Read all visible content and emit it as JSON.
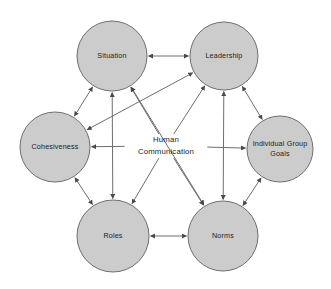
{
  "diagram": {
    "background_color": "#ffffff",
    "node_fill_color": "#cccccc",
    "node_stroke_color": "#6e6e6e",
    "edge_color": "#6e6e6e",
    "text_color": "#1c1c1c",
    "center": {
      "id": "human-communication",
      "line1": "Human",
      "line2": "Communication",
      "x": 166,
      "y": 146
    },
    "nodes": [
      {
        "id": "situation",
        "label": "Situation",
        "line1": "Situation",
        "line2": "",
        "cx": 112,
        "cy": 56,
        "r": 35
      },
      {
        "id": "leadership",
        "label": "Leadership",
        "line1": "Leadership",
        "line2": "",
        "cx": 224,
        "cy": 56,
        "r": 34
      },
      {
        "id": "cohesiveness",
        "label": "Cohesiveness",
        "line1": "Cohesiveness",
        "line2": "",
        "cx": 55,
        "cy": 147,
        "r": 35
      },
      {
        "id": "individual-group-goals",
        "label": "Individual Group Goals",
        "line1": "Individual Group",
        "line2": "Goals",
        "cx": 280,
        "cy": 149,
        "r": 33
      },
      {
        "id": "roles",
        "label": "Roles",
        "line1": "Roles",
        "line2": "",
        "cx": 113,
        "cy": 236,
        "r": 36
      },
      {
        "id": "norms",
        "label": "Norms",
        "line1": "Norms",
        "line2": "",
        "cx": 223,
        "cy": 236,
        "r": 35
      }
    ],
    "edges": [
      {
        "id": "edge-situation-leadership",
        "from": "situation",
        "to": "leadership",
        "arrows": "both"
      },
      {
        "id": "edge-situation-cohesiveness",
        "from": "situation",
        "to": "cohesiveness",
        "arrows": "both"
      },
      {
        "id": "edge-situation-roles",
        "from": "situation",
        "to": "roles",
        "arrows": "both"
      },
      {
        "id": "edge-cohesiveness-roles",
        "from": "cohesiveness",
        "to": "roles",
        "arrows": "both"
      },
      {
        "id": "edge-cohesiveness-leadership",
        "from": "cohesiveness",
        "to": "leadership",
        "arrows": "both"
      },
      {
        "id": "edge-situation-norms",
        "from": "situation",
        "to": "norms",
        "arrows": "both"
      },
      {
        "id": "edge-leadership-norms",
        "from": "leadership",
        "to": "norms",
        "arrows": "both"
      },
      {
        "id": "edge-leadership-goals",
        "from": "leadership",
        "to": "individual-group-goals",
        "arrows": "both"
      },
      {
        "id": "edge-goals-norms",
        "from": "individual-group-goals",
        "to": "norms",
        "arrows": "both"
      },
      {
        "id": "edge-roles-norms",
        "from": "roles",
        "to": "norms",
        "arrows": "both"
      },
      {
        "id": "edge-center-situation",
        "from": "human-communication",
        "to": "situation",
        "arrows": "to"
      },
      {
        "id": "edge-center-leadership",
        "from": "human-communication",
        "to": "leadership",
        "arrows": "to"
      },
      {
        "id": "edge-center-cohesiveness",
        "from": "human-communication",
        "to": "cohesiveness",
        "arrows": "to"
      },
      {
        "id": "edge-center-goals",
        "from": "human-communication",
        "to": "individual-group-goals",
        "arrows": "to"
      },
      {
        "id": "edge-center-roles",
        "from": "human-communication",
        "to": "roles",
        "arrows": "to"
      },
      {
        "id": "edge-center-norms",
        "from": "human-communication",
        "to": "norms",
        "arrows": "to"
      }
    ]
  }
}
